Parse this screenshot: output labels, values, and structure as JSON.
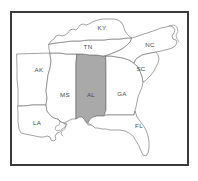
{
  "figure": {
    "kind": "us-southeast-region-map",
    "frame_border_color": "#3a3a3a",
    "background_color": "#ffffff",
    "outline_color": "#7d7d7d",
    "highlight_fill_color": "#a9a9a9"
  },
  "map": {
    "highlighted_state_code": "AL",
    "states": [
      {
        "code": "AK",
        "name": "state-arkansas",
        "highlighted": false,
        "label_x": 41,
        "label_y": 65,
        "outline": "M 19,49 L 52,48 L 53,56 L 52,63 L 50,70 L 49,78 L 48,86 L 49,93 L 48,100 L 42,100 L 34,100 L 26,101 L 20,101 L 20,92 L 20,84 L 19,74 L 19,64 Z"
      },
      {
        "code": "LA",
        "name": "state-louisiana",
        "highlighted": false,
        "label_x": 39,
        "label_y": 118,
        "outline": "M 20,101 L 26,101 L 34,100 L 42,100 L 48,100 L 49,106 L 52,110 L 56,113 L 60,114 L 63,117 L 66,118 L 69,119 L 67,122 L 64,124 L 62,127 L 59,128 L 57,131 L 58,134 L 56,136 L 53,135 L 52,132 L 49,131 L 46,132 L 42,132 L 37,131 L 32,130 L 27,129 L 23,128 L 21,124 L 20,117 L 20,109 Z"
      },
      {
        "code": "MS",
        "name": "state-mississippi",
        "highlighted": false,
        "label_x": 67,
        "label_y": 90,
        "outline": "M 52,48 L 56,48 L 62,48 L 68,49 L 74,49 L 79,49 L 78,58 L 78,68 L 78,78 L 78,88 L 78,98 L 78,108 L 78,114 L 74,114 L 70,116 L 66,118 L 63,117 L 60,114 L 56,113 L 52,110 L 49,106 L 48,100 L 49,93 L 48,86 L 49,78 L 50,70 L 52,63 L 53,56 Z"
      },
      {
        "code": "AL",
        "name": "state-alabama",
        "highlighted": true,
        "label_x": 93,
        "label_y": 90,
        "outline": "M 79,49 L 85,49 L 92,50 L 99,50 L 105,51 L 108,51 L 108,60 L 108,70 L 108,80 L 108,90 L 108,98 L 108,105 L 106,111 L 103,111 L 99,111 L 95,112 L 92,114 L 90,118 L 88,117 L 86,114 L 84,112 L 81,112 L 78,114 L 78,108 L 78,98 L 78,88 L 78,78 L 78,68 L 78,58 Z"
      },
      {
        "code": "GA",
        "name": "state-georgia",
        "highlighted": false,
        "label_x": 124,
        "label_y": 89,
        "outline": "M 108,51 L 113,51 L 119,52 L 125,53 L 131,55 L 136,58 L 140,62 L 142,66 L 144,71 L 145,77 L 144,82 L 142,87 L 140,92 L 139,97 L 138,102 L 137,106 L 136,110 L 132,110 L 126,110 L 119,110 L 113,110 L 108,110 L 106,111 L 108,105 L 108,98 L 108,90 L 108,80 L 108,70 L 108,60 Z"
      },
      {
        "code": "FL",
        "name": "state-florida",
        "highlighted": false,
        "label_x": 141,
        "label_y": 121,
        "outline": "M 90,118 L 92,114 L 95,112 L 99,111 L 103,111 L 106,111 L 108,110 L 113,110 L 119,110 L 126,110 L 132,110 L 136,110 L 137,106 L 139,112 L 142,116 L 145,120 L 148,125 L 150,131 L 151,137 L 151,143 L 150,148 L 148,151 L 145,150 L 143,146 L 141,141 L 138,136 L 135,131 L 131,128 L 127,126 L 122,125 L 117,125 L 112,125 L 108,124 L 104,124 L 100,123 L 97,123 L 95,121 L 93,120 Z"
      },
      {
        "code": "TN",
        "name": "state-tennessee",
        "highlighted": false,
        "label_x": 90,
        "label_y": 42,
        "outline": "M 51,39 L 58,38 L 66,37 L 74,36 L 82,36 L 90,35 L 98,35 L 106,35 L 114,34 L 122,34 L 129,33 L 134,33 L 132,37 L 128,41 L 124,44 L 120,46 L 115,48 L 110,50 L 105,51 L 99,50 L 92,50 L 85,49 L 79,49 L 74,49 L 68,49 L 62,48 L 56,48 L 52,48 L 51,44 Z"
      },
      {
        "code": "KY",
        "name": "state-kentucky",
        "highlighted": false,
        "label_x": 104,
        "label_y": 23,
        "outline": "M 51,39 L 53,36 L 56,34 L 58,31 L 61,30 L 64,31 L 67,30 L 70,28 L 72,25 L 75,24 L 78,25 L 80,23 L 82,20 L 85,19 L 88,20 L 91,19 L 94,17 L 97,16 L 100,15 L 104,14 L 108,14 L 112,14 L 116,14 L 120,15 L 123,17 L 125,20 L 126,23 L 127,26 L 129,29 L 131,31 L 134,33 L 129,33 L 122,34 L 114,34 L 106,35 L 98,35 L 90,35 L 82,36 L 74,36 L 66,37 L 58,38 Z"
      },
      {
        "code": "NC",
        "name": "state-north-carolina",
        "highlighted": false,
        "label_x": 152,
        "label_y": 40,
        "outline": "M 134,33 L 140,31 L 146,29 L 152,27 L 158,25 L 163,23 L 168,22 L 172,21 L 175,22 L 177,25 L 176,28 L 174,31 L 175,34 L 178,35 L 179,38 L 177,41 L 174,43 L 171,44 L 167,45 L 163,46 L 158,47 L 153,48 L 148,49 L 144,50 L 141,52 L 138,54 L 136,58 L 131,55 L 125,53 L 119,52 L 113,51 L 108,51 L 110,50 L 115,48 L 120,46 L 124,44 L 128,41 L 132,37 Z"
      },
      {
        "code": "SC",
        "name": "state-south-carolina",
        "highlighted": false,
        "label_x": 143,
        "label_y": 64,
        "outline": "M 136,58 L 138,54 L 141,52 L 144,50 L 148,49 L 153,48 L 158,47 L 160,50 L 161,54 L 160,58 L 158,62 L 156,66 L 153,70 L 150,73 L 147,76 L 145,77 L 144,71 L 142,66 L 140,62 Z"
      }
    ],
    "coast_detail_paths": [
      "M 60,114 L 62,117 L 61,120 L 58,121 L 57,124 L 59,126 L 62,125",
      "M 66,118 L 68,121 L 67,124 L 64,126 L 63,129 L 65,131",
      "M 171,21 L 176,20 L 179,22 L 180,26 L 178,30 L 179,34 L 181,37",
      "M 88,117 L 90,120 L 93,120"
    ]
  },
  "labels": {
    "AK": "AK",
    "LA": "LA",
    "MS": "MS",
    "AL": "AL",
    "GA": "GA",
    "FL": "FL",
    "TN": "TN",
    "KY": "KY",
    "NC": "NC",
    "SC": "SC"
  }
}
